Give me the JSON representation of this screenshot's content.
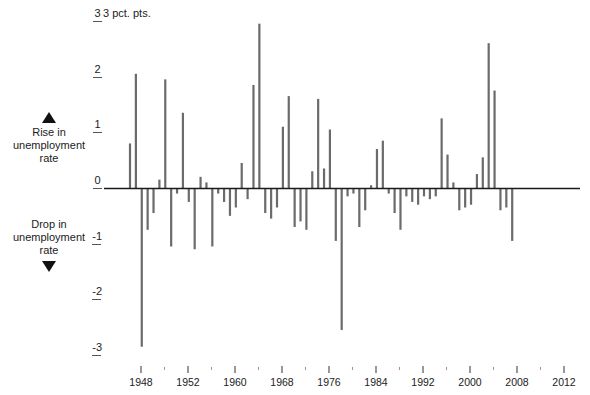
{
  "figure": {
    "unit_label": "3 pct. pts.",
    "legend": {
      "rise": {
        "icon": "triangle-up",
        "line1": "Rise in",
        "line2": "unemployment",
        "line3": "rate"
      },
      "drop": {
        "icon": "triangle-down",
        "line1": "Drop in",
        "line2": "unemployment",
        "line3": "rate"
      }
    },
    "bar_color": "#6b6b6b",
    "axis_color": "#1b1b1b"
  },
  "chart_data": {
    "type": "bar",
    "title": "",
    "subtitle": "",
    "xlabel": "",
    "ylabel": "pct. pts.",
    "unit": "pct. pts.",
    "ylim": [
      -3,
      3
    ],
    "yticks": [
      3,
      2,
      1,
      0,
      -1,
      -2,
      -3
    ],
    "ytick_labels": [
      "3",
      "2",
      "1",
      "0",
      "-1",
      "-2",
      "-3"
    ],
    "grid": false,
    "legend_position": "left",
    "xtick_labels": [
      "1948",
      "1952",
      "1960",
      "1968",
      "1976",
      "1984",
      "1992",
      "2000",
      "2008",
      "2012"
    ],
    "xtick_years": [
      1948,
      1952,
      1960,
      1968,
      1976,
      1984,
      1992,
      2000,
      2008,
      2012
    ],
    "minor_tick_interval_years": 4,
    "x": [
      1948,
      1949,
      1950,
      1951,
      1952,
      1953,
      1954,
      1955,
      1956,
      1957,
      1958,
      1959,
      1960,
      1961,
      1962,
      1963,
      1964,
      1965,
      1966,
      1967,
      1968,
      1969,
      1970,
      1971,
      1972,
      1973,
      1974,
      1975,
      1976,
      1977,
      1978,
      1979,
      1980,
      1981,
      1982,
      1983,
      1984,
      1985,
      1986,
      1987,
      1988,
      1989,
      1990,
      1991,
      1992,
      1993,
      1994,
      1995,
      1996,
      1997,
      1998,
      1999,
      2000,
      2001,
      2002,
      2003,
      2004,
      2005,
      2006,
      2007,
      2008,
      2009,
      2010,
      2011,
      2012,
      2013
    ],
    "categories": [
      "1948",
      "1949",
      "1950",
      "1951",
      "1952",
      "1953",
      "1954",
      "1955",
      "1956",
      "1957",
      "1958",
      "1959",
      "1960",
      "1961",
      "1962",
      "1963",
      "1964",
      "1965",
      "1966",
      "1967",
      "1968",
      "1969",
      "1970",
      "1971",
      "1972",
      "1973",
      "1974",
      "1975",
      "1976",
      "1977",
      "1978",
      "1979",
      "1980",
      "1981",
      "1982",
      "1983",
      "1984",
      "1985",
      "1986",
      "1987",
      "1988",
      "1989",
      "1990",
      "1991",
      "1992",
      "1993",
      "1994",
      "1995",
      "1996",
      "1997",
      "1998",
      "1999",
      "2000",
      "2001",
      "2002",
      "2003",
      "2004",
      "2005",
      "2006",
      "2007",
      "2008",
      "2009",
      "2010",
      "2011",
      "2012",
      "2013"
    ],
    "values": [
      0.8,
      2.05,
      -2.85,
      -0.75,
      -0.45,
      0.15,
      1.95,
      -1.05,
      -0.1,
      1.35,
      -0.25,
      -1.1,
      0.2,
      0.1,
      -1.05,
      -0.1,
      -0.25,
      -0.5,
      -0.35,
      0.45,
      -0.2,
      1.85,
      2.95,
      -0.45,
      -0.55,
      -0.35,
      1.1,
      1.65,
      -0.7,
      -0.6,
      -0.75,
      0.3,
      1.6,
      0.35,
      1.05,
      -0.95,
      -2.55,
      -0.15,
      -0.1,
      -0.7,
      -0.4,
      0.05,
      0.7,
      0.85,
      -0.1,
      -0.45,
      -0.75,
      -0.15,
      -0.25,
      -0.3,
      -0.15,
      -0.2,
      -0.15,
      1.25,
      0.6,
      0.1,
      -0.4,
      -0.35,
      -0.3,
      0.25,
      0.55,
      2.6,
      1.75,
      -0.4,
      -0.35,
      -0.95
    ],
    "series": [
      {
        "name": "Annual change in unemployment rate",
        "values": [
          0.8,
          2.05,
          -2.85,
          -0.75,
          -0.45,
          0.15,
          1.95,
          -1.05,
          -0.1,
          1.35,
          -0.25,
          -1.1,
          0.2,
          0.1,
          -1.05,
          -0.1,
          -0.25,
          -0.5,
          -0.35,
          0.45,
          -0.2,
          1.85,
          2.95,
          -0.45,
          -0.55,
          -0.35,
          1.1,
          1.65,
          -0.7,
          -0.6,
          -0.75,
          0.3,
          1.6,
          0.35,
          1.05,
          -0.95,
          -2.55,
          -0.15,
          -0.1,
          -0.7,
          -0.4,
          0.05,
          0.7,
          0.85,
          -0.1,
          -0.45,
          -0.75,
          -0.15,
          -0.25,
          -0.3,
          -0.15,
          -0.2,
          -0.15,
          1.25,
          0.6,
          0.1,
          -0.4,
          -0.35,
          -0.3,
          0.25,
          0.55,
          2.6,
          1.75,
          -0.4,
          -0.35,
          -0.95
        ]
      }
    ]
  }
}
